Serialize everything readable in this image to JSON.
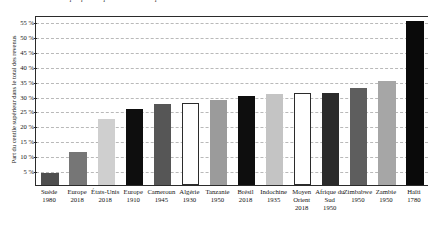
{
  "chart_data": {
    "type": "bar",
    "title": "Graphique : la part du centile supérieur dans le total des revenus",
    "xlabel": "",
    "ylabel": "Part du centile supérieur dans le total des revenus",
    "ylim": [
      0,
      57
    ],
    "grid": true,
    "legend": "none",
    "ytick_labels": [
      "5 %",
      "10 %",
      "15 %",
      "20 %",
      "25 %",
      "30 %",
      "35 %",
      "40 %",
      "45 %",
      "50 %",
      "55 %"
    ],
    "ytick_values": [
      5,
      10,
      15,
      20,
      25,
      30,
      35,
      40,
      45,
      50,
      55
    ],
    "categories": [
      "Suède",
      "Europe",
      "États-Unis",
      "Europe",
      "Cameroun",
      "Algérie",
      "Tanzanie",
      "Brésil",
      "Indochine",
      "Moyen Orient",
      "Afrique du Sud",
      "Zimbabwe",
      "Zambie",
      "Haïti"
    ],
    "category_years": [
      "1980",
      "2018",
      "2018",
      "1910",
      "1945",
      "1930",
      "1950",
      "2018",
      "1935",
      "2018",
      "1950",
      "1950",
      "1950",
      "1780"
    ],
    "values": [
      4,
      11,
      22,
      25.5,
      27,
      27.5,
      28.5,
      30,
      30.5,
      31,
      31,
      32.5,
      35,
      55
    ],
    "bar_colors": [
      "#4f4f4f",
      "#767676",
      "#cfcfcf",
      "#0e0e0e",
      "#565656",
      "#ffffff",
      "#9b9b9b",
      "#0e0e0e",
      "#c4c4c4",
      "#ffffff",
      "#2b2b2b",
      "#5e5e5e",
      "#a6a6a6",
      "#0a0a0a"
    ]
  }
}
